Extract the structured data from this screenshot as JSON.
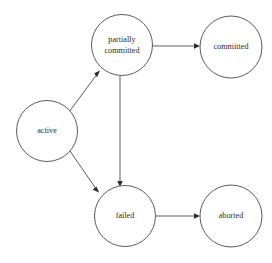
{
  "diagram": {
    "background_color": "#ffffff",
    "stroke_color": "#4a4a4a",
    "text_color": "#2b2b2b",
    "node_radius": 30.5,
    "nodes": [
      {
        "id": "active",
        "label": "active",
        "lines": [
          "active"
        ],
        "cx": 47,
        "cy": 131,
        "r": 30.5
      },
      {
        "id": "partially-committed",
        "label": "partially committed",
        "lines": [
          "partially",
          "committed"
        ],
        "cx": 122,
        "cy": 45,
        "r": 30.5
      },
      {
        "id": "committed",
        "label": "committed",
        "lines": [
          "committed"
        ],
        "cx": 231,
        "cy": 47,
        "r": 31
      },
      {
        "id": "failed",
        "label": "failed",
        "lines": [
          "failed"
        ],
        "cx": 125,
        "cy": 216,
        "r": 30.5
      },
      {
        "id": "aborted",
        "label": "aborted",
        "lines": [
          "aborted"
        ],
        "cx": 231,
        "cy": 216,
        "r": 31
      }
    ],
    "edges": [
      {
        "id": "active-to-partially-committed",
        "from": "active",
        "to": "partially-committed",
        "label": "",
        "x1": 69,
        "y1": 112,
        "x2": 100,
        "y2": 71
      },
      {
        "id": "active-to-failed",
        "from": "active",
        "to": "failed",
        "label": "",
        "x1": 70,
        "y1": 151,
        "x2": 99,
        "y2": 192
      },
      {
        "id": "partially-committed-to-committed",
        "from": "partially-committed",
        "to": "committed",
        "label": "",
        "x1": 153,
        "y1": 46,
        "x2": 199,
        "y2": 46
      },
      {
        "id": "partially-committed-to-failed",
        "from": "partially-committed",
        "to": "failed",
        "label": "",
        "x1": 120,
        "y1": 76,
        "x2": 120,
        "y2": 186
      },
      {
        "id": "failed-to-aborted",
        "from": "failed",
        "to": "aborted",
        "label": "",
        "x1": 156,
        "y1": 216,
        "x2": 199,
        "y2": 216
      }
    ]
  }
}
